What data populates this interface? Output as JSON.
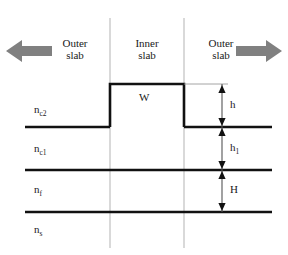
{
  "figure": {
    "background": "#ffffff",
    "line_color": "#111111",
    "guide_color": "#b3b3b3",
    "arrow_fill": "#808080",
    "text_color": "#1a1a1a"
  },
  "region_labels": [
    {
      "name": "outer-slab-left",
      "line1": "Outer",
      "line2": "slab"
    },
    {
      "name": "inner-slab",
      "line1": "Inner",
      "line2": "slab"
    },
    {
      "name": "outer-slab-right",
      "line1": "Outer",
      "line2": "slab"
    }
  ],
  "direction_arrows": [
    {
      "name": "left-arrow",
      "direction": "left",
      "color": "#808080"
    },
    {
      "name": "right-arrow",
      "direction": "right",
      "color": "#808080"
    }
  ],
  "refractive_indices": [
    {
      "name": "n-c2",
      "symbol": "n",
      "subscript": "c2"
    },
    {
      "name": "n-c1",
      "symbol": "n",
      "subscript": "c1"
    },
    {
      "name": "n-f",
      "symbol": "n",
      "subscript": "f"
    },
    {
      "name": "n-s",
      "symbol": "n",
      "subscript": "s"
    }
  ],
  "dimension_labels": [
    {
      "name": "dim-h",
      "symbol": "h",
      "subscript": ""
    },
    {
      "name": "dim-h1",
      "symbol": "h",
      "subscript": "1"
    },
    {
      "name": "dim-H",
      "symbol": "H",
      "subscript": ""
    }
  ],
  "width_label": {
    "name": "rib-width",
    "text": "W"
  }
}
